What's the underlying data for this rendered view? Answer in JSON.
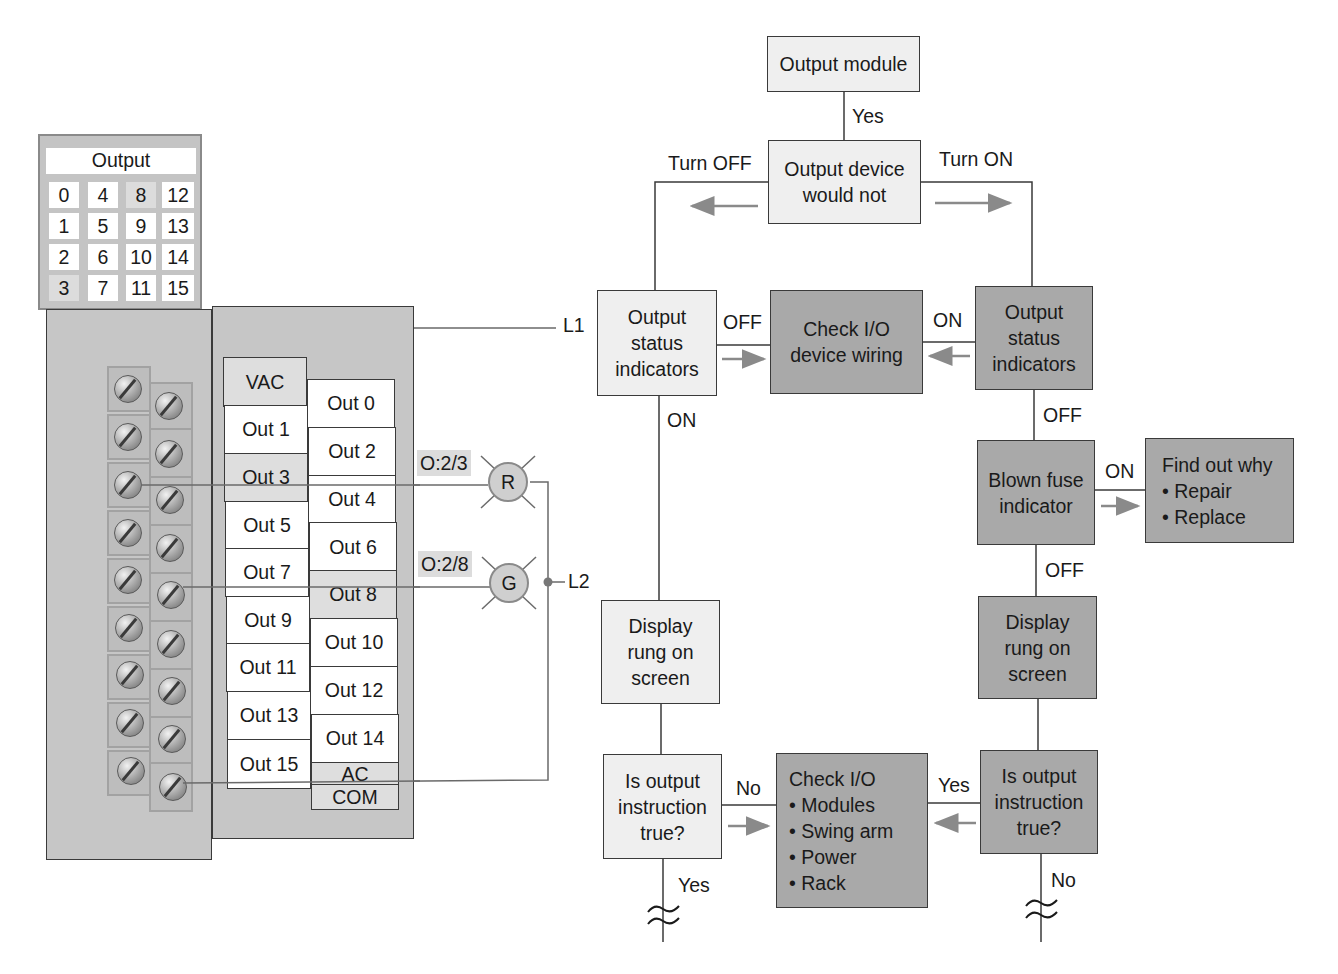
{
  "status_panel": {
    "title": "Output",
    "cells": [
      [
        "0",
        "4",
        "8",
        "12"
      ],
      [
        "1",
        "5",
        "9",
        "13"
      ],
      [
        "2",
        "6",
        "10",
        "14"
      ],
      [
        "3",
        "7",
        "11",
        "15"
      ]
    ],
    "lit_cells": [
      "8",
      "3"
    ]
  },
  "terminal_labels": {
    "left_column": [
      "VAC",
      "Out 1",
      "Out 3",
      "Out 5",
      "Out 7",
      "Out 9",
      "Out 11",
      "Out 13",
      "Out 15"
    ],
    "right_column": [
      "Out 0",
      "Out 2",
      "Out 4",
      "Out 6",
      "Out 8",
      "Out 10",
      "Out 12",
      "Out 14"
    ],
    "ac_label": "AC",
    "com_label": "COM"
  },
  "field_wiring": {
    "l1_label": "L1",
    "l2_label": "L2",
    "lamps": [
      {
        "letter": "R",
        "address": "O:2/3"
      },
      {
        "letter": "G",
        "address": "O:2/8"
      }
    ]
  },
  "flowchart": {
    "output_module": "Output module",
    "yes_top": "Yes",
    "device_would_not": [
      "Output device",
      "would not"
    ],
    "turn_off": "Turn OFF",
    "turn_on": "Turn ON",
    "left_status": [
      "Output",
      "status",
      "indicators"
    ],
    "right_status": [
      "Output",
      "status",
      "indicators"
    ],
    "check_wiring": [
      "Check I/O",
      "device wiring"
    ],
    "off_label_left": "OFF",
    "on_label_right": "ON",
    "on_below_left": "ON",
    "off_below_right": "OFF",
    "blown_fuse": [
      "Blown fuse",
      "indicator"
    ],
    "fuse_on": "ON",
    "find_out_why": {
      "title": "Find out why",
      "items": [
        "• Repair",
        "• Replace"
      ]
    },
    "fuse_off": "OFF",
    "display_left": [
      "Display",
      "rung on",
      "screen"
    ],
    "display_right": [
      "Display",
      "rung on",
      "screen"
    ],
    "question_left": [
      "Is output",
      "instruction",
      "true?"
    ],
    "question_right": [
      "Is output",
      "instruction",
      "true?"
    ],
    "no_left": "No",
    "yes_right": "Yes",
    "check_io": {
      "title": "Check I/O",
      "items": [
        "• Modules",
        "• Swing arm",
        "• Power",
        "• Rack"
      ]
    },
    "yes_bottom_left": "Yes",
    "no_bottom_right": "No"
  },
  "colors": {
    "light_box": "#efefef",
    "dark_box": "#a9a9a9",
    "arrow": "#8a8a8a",
    "line": "#3a3a3a",
    "module": "#c6c6c6"
  }
}
